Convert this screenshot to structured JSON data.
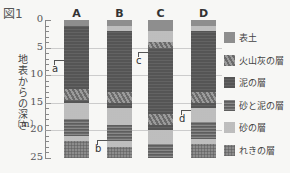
{
  "figure_title": "図1",
  "y_axis": {
    "label": "地表からの深さ",
    "unit": "〔m〕",
    "ticks": [
      "0",
      "5",
      "10",
      "15",
      "20",
      "25"
    ],
    "min": 0,
    "max": 25
  },
  "columns": [
    {
      "name": "A",
      "layers": [
        {
          "type": "topsoil",
          "from": 0,
          "to": 1
        },
        {
          "type": "mud",
          "from": 1,
          "to": 12.5
        },
        {
          "type": "ash",
          "from": 12.5,
          "to": 14.5
        },
        {
          "type": "mud",
          "from": 14.5,
          "to": 15
        },
        {
          "type": "sand",
          "from": 15,
          "to": 18
        },
        {
          "type": "sandmud",
          "from": 18,
          "to": 21
        },
        {
          "type": "sand",
          "from": 21,
          "to": 22
        },
        {
          "type": "gravel",
          "from": 22,
          "to": 25
        }
      ]
    },
    {
      "name": "B",
      "layers": [
        {
          "type": "topsoil",
          "from": 0,
          "to": 1
        },
        {
          "type": "sand",
          "from": 1,
          "to": 2
        },
        {
          "type": "mud",
          "from": 2,
          "to": 13
        },
        {
          "type": "ash",
          "from": 13,
          "to": 15
        },
        {
          "type": "mud",
          "from": 15,
          "to": 16
        },
        {
          "type": "sand",
          "from": 16,
          "to": 19
        },
        {
          "type": "sandmud",
          "from": 19,
          "to": 22
        },
        {
          "type": "sand",
          "from": 22,
          "to": 23
        },
        {
          "type": "gravel",
          "from": 23,
          "to": 25
        }
      ]
    },
    {
      "name": "C",
      "layers": [
        {
          "type": "topsoil",
          "from": 0,
          "to": 2
        },
        {
          "type": "sand",
          "from": 2,
          "to": 4
        },
        {
          "type": "ash",
          "from": 4,
          "to": 5
        },
        {
          "type": "mud",
          "from": 5,
          "to": 17
        },
        {
          "type": "ash",
          "from": 17,
          "to": 19
        },
        {
          "type": "mud",
          "from": 19,
          "to": 20
        },
        {
          "type": "sand",
          "from": 20,
          "to": 22.5
        },
        {
          "type": "sandmud",
          "from": 22.5,
          "to": 25
        }
      ]
    },
    {
      "name": "D",
      "layers": [
        {
          "type": "topsoil",
          "from": 0,
          "to": 1
        },
        {
          "type": "sand",
          "from": 1,
          "to": 2
        },
        {
          "type": "mud",
          "from": 2,
          "to": 13
        },
        {
          "type": "ash",
          "from": 13,
          "to": 15
        },
        {
          "type": "mud",
          "from": 15,
          "to": 16
        },
        {
          "type": "sand",
          "from": 16,
          "to": 18.5
        },
        {
          "type": "sandmud",
          "from": 18.5,
          "to": 21.5
        },
        {
          "type": "sand",
          "from": 21.5,
          "to": 22.5
        },
        {
          "type": "gravel",
          "from": 22.5,
          "to": 25
        }
      ]
    }
  ],
  "markers": [
    {
      "label": "a",
      "column": "A",
      "depth": 8
    },
    {
      "label": "b",
      "column": "B",
      "depth": 22.5
    },
    {
      "label": "c",
      "column": "C",
      "depth": 6.5
    },
    {
      "label": "d",
      "column": "D",
      "depth": 17
    }
  ],
  "legend": [
    {
      "type": "topsoil",
      "label": "表土"
    },
    {
      "type": "ash",
      "label": "火山灰の層"
    },
    {
      "type": "mud",
      "label": "泥の層"
    },
    {
      "type": "sandmud",
      "label": "砂と泥の層"
    },
    {
      "type": "sand",
      "label": "砂の層"
    },
    {
      "type": "gravel",
      "label": "れきの層"
    }
  ]
}
